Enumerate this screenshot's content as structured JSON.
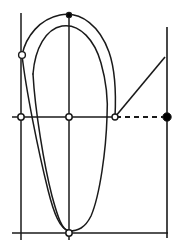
{
  "figure": {
    "width": 178,
    "height": 251,
    "background_color": "#ffffff",
    "stroke_color": "#1a1a1a",
    "marker_fill_open": "#ffffff",
    "marker_fill_solid": "#000000"
  },
  "axes": {
    "horizontal_axis": {
      "name": "horizontal-axis",
      "y": 117,
      "x_start": 12,
      "x_end": 115,
      "style": "solid",
      "stroke_width": 1.7
    },
    "horizontal_axis_dashed": {
      "name": "horizontal-axis-dashed-extension",
      "y": 117,
      "x_start": 116,
      "x_end": 166,
      "style": "dashed",
      "dash_pattern": "5,4",
      "stroke_width": 1.8
    },
    "vertical_axis_left": {
      "name": "vertical-axis-left",
      "x": 21,
      "y_start": 13,
      "y_end": 240,
      "style": "solid",
      "stroke_width": 1.5
    },
    "vertical_axis_center": {
      "name": "vertical-axis-center",
      "x": 69,
      "y_start": 14,
      "y_end": 240,
      "style": "solid",
      "stroke_width": 1.5
    },
    "vertical_axis_right": {
      "name": "vertical-axis-right",
      "x": 167,
      "y_start": 27,
      "y_end": 238,
      "style": "solid",
      "stroke_width": 1.6
    },
    "bottom_axis": {
      "name": "bottom-horizontal-axis",
      "y": 233,
      "x_start": 12,
      "x_end": 168,
      "style": "solid",
      "stroke_width": 1.7
    }
  },
  "diagonal_line": {
    "name": "diagonal-connector-line",
    "x1": 115,
    "y1": 117,
    "x2": 165,
    "y2": 57,
    "style": "solid",
    "stroke_width": 1.6
  },
  "curves": {
    "outer_loop": {
      "name": "outer-loop-curve",
      "description": "Upper outer arc sweeping from left marker over the top peak and descending to the right origin point",
      "path": "M 22,55 C 26,36 40,19 60,15 C 82,11 100,27 109,52 C 116,72 116,97 115,117",
      "stroke_width": 1.5
    },
    "inner_loop": {
      "name": "inner-loop-curve",
      "description": "Inner arc following just beneath the outer loop",
      "path": "M 33,74 C 35,48 46,29 62,26 C 80,23 95,41 101,63 C 107,84 108,102 107,117",
      "stroke_width": 1.5
    },
    "left_descending": {
      "name": "left-descending-curve",
      "description": "Left side of the closed loop descending from the open circle marker to the bottom",
      "path": "M 22,55 C 26,90 38,150 48,190 C 54,214 60,229 69,231",
      "stroke_width": 1.5
    },
    "inner_left_descending": {
      "name": "inner-left-descending-curve",
      "description": "Inner left branch descending toward the bottom marker",
      "path": "M 33,74 C 35,110 44,165 52,196 C 58,218 62,230 69,231",
      "stroke_width": 1.5
    },
    "right_descending": {
      "name": "right-descending-curve",
      "description": "Right side of the closed loop falling from the origin point down to the bottom marker",
      "path": "M 107,117 C 106,150 100,195 91,216 C 85,228 78,231 69,231",
      "stroke_width": 1.5
    }
  },
  "markers": [
    {
      "name": "marker-left-curve-endpoint",
      "type": "open-circle",
      "x": 22,
      "y": 55,
      "radius": 3.4,
      "label": "left curve endpoint on left vertical axis"
    },
    {
      "name": "marker-top-peak",
      "type": "cross-point",
      "x": 69,
      "y": 15,
      "radius": 2.6,
      "label": "top peak on center vertical axis"
    },
    {
      "name": "marker-origin-left",
      "type": "open-circle",
      "x": 21,
      "y": 117,
      "radius": 3.2,
      "label": "intersection of left vertical and horizontal axis"
    },
    {
      "name": "marker-origin-center",
      "type": "open-circle",
      "x": 69,
      "y": 117,
      "radius": 3.2,
      "label": "intersection of center vertical and horizontal axis"
    },
    {
      "name": "marker-curve-axis-intersection",
      "type": "open-circle",
      "x": 115,
      "y": 117,
      "radius": 3.0,
      "label": "curve meets horizontal axis, start of dashed segment and diagonal"
    },
    {
      "name": "marker-right-solid-dot",
      "type": "solid-dot",
      "x": 167,
      "y": 117,
      "radius": 4.2,
      "label": "solid endpoint of dashed line on right vertical axis"
    },
    {
      "name": "marker-bottom-vertex",
      "type": "open-circle",
      "x": 69,
      "y": 233,
      "radius": 3.2,
      "label": "bottom vertex of loop on bottom axis"
    }
  ]
}
